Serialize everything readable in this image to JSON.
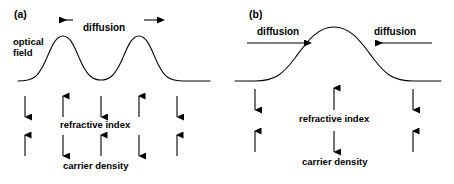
{
  "figure": {
    "width": 454,
    "height": 184,
    "background": "#ffffff",
    "stroke_color": "#000000",
    "text_color": "#000000"
  },
  "panels": [
    {
      "id": "a",
      "label": "(a)",
      "curve_description": "double-peaked optical field profile",
      "optical_field_label_line1": "optical",
      "optical_field_label_line2": "field",
      "diffusion_label": "diffusion",
      "diffusion_direction": "outward",
      "diffusion_arrows": [
        {
          "name": "diffusion-arrow-left",
          "direction": "left"
        },
        {
          "name": "diffusion-arrow-right",
          "direction": "right"
        }
      ],
      "rows": [
        {
          "name": "refractive-index",
          "label": "refractive index",
          "arrows": [
            "down",
            "up",
            "down",
            "up",
            "down"
          ]
        },
        {
          "name": "carrier-density",
          "label": "carrier density",
          "arrows": [
            "up",
            "down",
            "up",
            "down",
            "up"
          ]
        }
      ]
    },
    {
      "id": "b",
      "label": "(b)",
      "curve_description": "single-peaked Gaussian optical field profile",
      "diffusion_label_left": "diffusion",
      "diffusion_label_right": "diffusion",
      "diffusion_direction": "inward",
      "diffusion_arrows": [
        {
          "name": "diffusion-arrow-left",
          "direction": "right"
        },
        {
          "name": "diffusion-arrow-right",
          "direction": "left"
        }
      ],
      "rows": [
        {
          "name": "refractive-index",
          "label": "refractive index",
          "arrows": [
            "down",
            "up",
            "down"
          ]
        },
        {
          "name": "carrier-density",
          "label": "carrier density",
          "arrows": [
            "up",
            "down",
            "up"
          ]
        }
      ]
    }
  ]
}
